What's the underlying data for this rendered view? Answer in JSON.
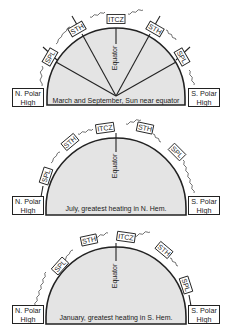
{
  "colors": {
    "fill": "#e4e4e4",
    "stroke": "#222222",
    "background": "#ffffff"
  },
  "labels": {
    "equator": "Equator",
    "itcz": "ITCZ",
    "sth": "STH",
    "spl": "SPL",
    "north_box_line1": "N. Polar",
    "north_box_line2": "High",
    "south_box_line1": "S. Polar",
    "south_box_line2": "High"
  },
  "panels": [
    {
      "id": "equinox",
      "caption": "March and September, Sun near equator"
    },
    {
      "id": "july",
      "caption": "July, greatest heating in N. Hem."
    },
    {
      "id": "january",
      "caption": "January, greatest heating in S. Hem."
    }
  ]
}
